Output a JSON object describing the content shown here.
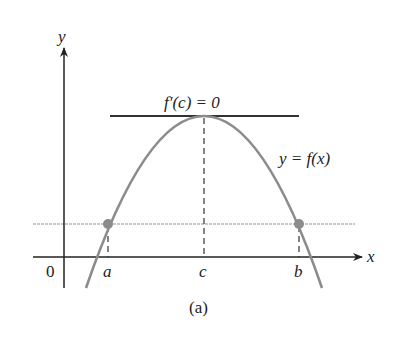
{
  "diagram": {
    "caption": "(a)",
    "axes": {
      "x_label": "x",
      "y_label": "y",
      "origin_label": "0"
    },
    "curve_label": "y = f(x)",
    "tangent_label": "f′(c) = 0",
    "points": {
      "a": "a",
      "b": "b",
      "c": "c"
    },
    "colors": {
      "axis": "#222222",
      "curve": "#8c8c8c",
      "tangent": "#333333",
      "level_line": "#c8c8c8",
      "point": "#8c8c8c"
    }
  }
}
